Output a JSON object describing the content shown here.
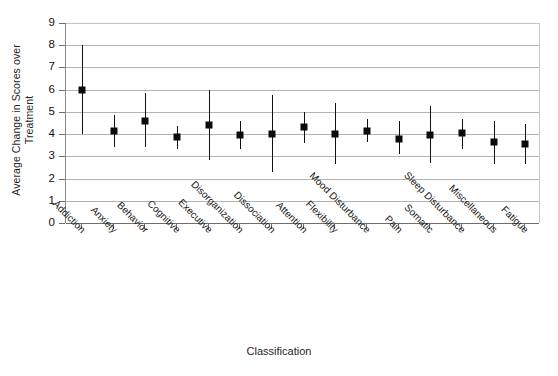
{
  "chart_data": {
    "type": "scatter",
    "title": "",
    "xlabel": "Classification",
    "ylabel": "Average Change in Scores over Treatment",
    "ylabel_line1": "Average Change in Scores over",
    "ylabel_line2": "Treatment",
    "ylim": [
      0,
      9
    ],
    "yticks": [
      0,
      1,
      2,
      3,
      4,
      5,
      6,
      7,
      8,
      9
    ],
    "ytick_labels": [
      "0",
      "1",
      "2",
      "3",
      "4",
      "5",
      "6",
      "7",
      "8",
      "9"
    ],
    "grid": true,
    "legend": "none",
    "marker_color": "#0b0b0b",
    "errorbar_color": "#101010",
    "gridline_color": "#b3b3b3",
    "axis_color": "#6e6e6e",
    "categories": [
      "Addiction",
      "Anxiety",
      "Behavior",
      "Cognitive",
      "Executive",
      "Disorganization",
      "Dissociation",
      "Attention",
      "Flexibility",
      "Mood Disturbance",
      "Pain",
      "Somatic",
      "Sleep Disturbance",
      "Miscellaneous",
      "Fatigue"
    ],
    "series": [
      {
        "name": "Average change in scores over treatment",
        "values": [
          6.0,
          4.15,
          4.6,
          3.85,
          4.4,
          3.95,
          4.0,
          4.3,
          4.0,
          4.15,
          3.8,
          3.95,
          4.05,
          3.65,
          3.55
        ],
        "error_low": [
          4.0,
          3.4,
          3.4,
          3.35,
          2.85,
          3.35,
          2.3,
          3.6,
          2.65,
          3.65,
          3.1,
          2.7,
          3.35,
          2.65,
          2.65
        ],
        "error_high": [
          8.0,
          4.85,
          5.85,
          4.35,
          6.0,
          4.6,
          5.75,
          5.0,
          5.4,
          4.7,
          4.6,
          5.25,
          4.7,
          4.6,
          4.45
        ]
      }
    ]
  }
}
